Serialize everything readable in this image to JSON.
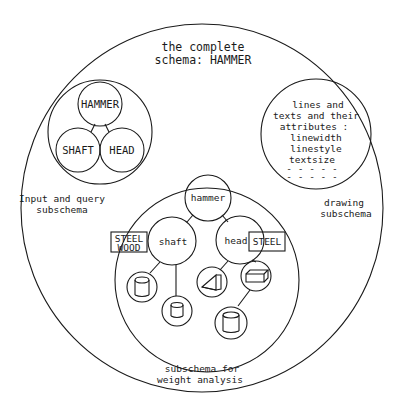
{
  "diagram": {
    "title_line1": "the complete",
    "title_line2": "schema: HAMMER",
    "input_subschema": {
      "label_line1": "Input and query",
      "label_line2": "subschema",
      "nodes": [
        "HAMMER",
        "SHAFT",
        "HEAD"
      ]
    },
    "drawing_subschema": {
      "label_line1": "drawing",
      "label_line2": "subschema",
      "content": [
        "lines and",
        "texts and their",
        "attributes :",
        "linewidth",
        "linestyle",
        "textsize",
        "- - - - -",
        "- - - - -"
      ]
    },
    "weight_subschema": {
      "label_line1": "subschema for",
      "label_line2": "weight analysis",
      "nodes": {
        "root": "hammer",
        "left": "shaft",
        "right": "head"
      },
      "material_left_line1": "STEEL",
      "material_left_line2": "WOOD",
      "material_right": "STEEL",
      "shape_icons": [
        "cylinder-icon",
        "small-cylinder-icon",
        "wedge-icon",
        "box-icon",
        "large-cylinder-icon"
      ]
    },
    "colors": {
      "stroke": "#1a1a1a",
      "background": "#ffffff"
    }
  }
}
